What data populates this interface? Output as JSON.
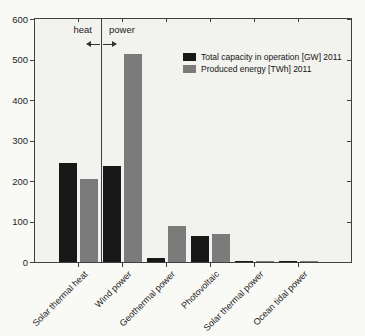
{
  "page": {
    "background": "#f9f9f6",
    "plot_background": "#f2f2ee",
    "axis_color": "#3f3f3f"
  },
  "chart_data": {
    "type": "bar",
    "title": "",
    "xlabel": "",
    "ylabel": "",
    "categories": [
      "Solar thermal heat",
      "Wind power",
      "Geothermal power",
      "Photovoltaic",
      "Solar thermal power",
      "Ocean tidal power"
    ],
    "series": [
      {
        "name": "Total capacity in operation [GW] 2011",
        "color": "#181818",
        "values": [
          245,
          238,
          11,
          65,
          2,
          1
        ]
      },
      {
        "name": "Produced energy [TWh] 2011",
        "color": "#7b7b7b",
        "values": [
          204,
          513,
          88,
          68,
          3,
          1
        ]
      }
    ],
    "ylim": [
      0,
      600
    ],
    "yticks": [
      0,
      100,
      200,
      300,
      400,
      500,
      600
    ],
    "grid": false,
    "legend_position": "inside-top-right",
    "annotations": {
      "divider": {
        "between": [
          "Solar thermal heat",
          "Wind power"
        ],
        "left_label": "heat",
        "right_label": "power"
      }
    }
  }
}
